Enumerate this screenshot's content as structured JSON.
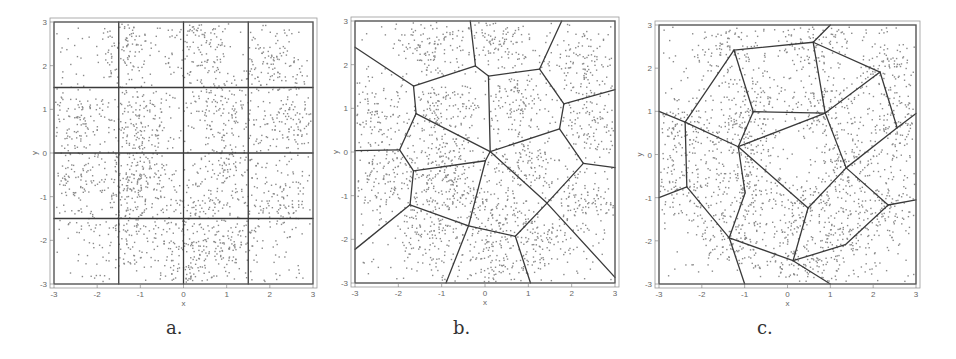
{
  "figure": {
    "captions": [
      "a.",
      "b.",
      "c."
    ]
  },
  "chart_data": [
    {
      "type": "scatter",
      "title": "a.",
      "xlabel": "x",
      "ylabel": "y",
      "xlim": [
        -3,
        3
      ],
      "ylim": [
        -3,
        3
      ],
      "xticks": [
        -3,
        -2,
        -1,
        0,
        1,
        2,
        3
      ],
      "yticks": [
        -3,
        -2,
        -1,
        0,
        1,
        2,
        3
      ],
      "grid": false,
      "frame": {
        "left": 54,
        "top": 22,
        "right": 313,
        "bottom": 284,
        "caption_x": 166,
        "caption_y": 335
      },
      "clusters": [
        {
          "x": -1.3,
          "y": 2.4
        },
        {
          "x": 0.3,
          "y": 2.6
        },
        {
          "x": 2.2,
          "y": 2.0
        },
        {
          "x": -2.5,
          "y": 0.7
        },
        {
          "x": -1.0,
          "y": 0.9
        },
        {
          "x": 0.8,
          "y": 1.1
        },
        {
          "x": 2.5,
          "y": 0.7
        },
        {
          "x": -2.5,
          "y": -0.7
        },
        {
          "x": -1.0,
          "y": -0.9
        },
        {
          "x": 1.0,
          "y": -0.3
        },
        {
          "x": 2.3,
          "y": -1.1
        },
        {
          "x": -1.4,
          "y": -1.9
        },
        {
          "x": 0.1,
          "y": -2.5
        },
        {
          "x": 1.1,
          "y": -2.1
        },
        {
          "x": -1.0,
          "y": -0.2
        },
        {
          "x": 0.3,
          "y": -1.3
        }
      ],
      "partition": {
        "kind": "grid",
        "lines": [
          {
            "x1": -1.5,
            "y1": -3,
            "x2": -1.5,
            "y2": 3
          },
          {
            "x1": 0,
            "y1": -3,
            "x2": 0,
            "y2": 3
          },
          {
            "x1": 1.5,
            "y1": -3,
            "x2": 1.5,
            "y2": 3
          },
          {
            "x1": -3,
            "y1": 1.5,
            "x2": 3,
            "y2": 1.5
          },
          {
            "x1": -3,
            "y1": 0,
            "x2": 3,
            "y2": 0
          },
          {
            "x1": -3,
            "y1": -1.5,
            "x2": 3,
            "y2": -1.5
          }
        ]
      }
    },
    {
      "type": "scatter",
      "title": "b.",
      "xlabel": "x",
      "ylabel": "y",
      "xlim": [
        -3,
        3
      ],
      "ylim": [
        -3,
        3
      ],
      "xticks": [
        -3,
        -2,
        -1,
        0,
        1,
        2,
        3
      ],
      "yticks": [
        -3,
        -2,
        -1,
        0,
        1,
        2,
        3
      ],
      "grid": false,
      "frame": {
        "left": 355,
        "top": 21,
        "right": 615,
        "bottom": 283,
        "caption_x": 453,
        "caption_y": 335
      },
      "clusters": [
        {
          "x": -1.3,
          "y": 2.4
        },
        {
          "x": 0.3,
          "y": 2.6
        },
        {
          "x": 2.2,
          "y": 2.0
        },
        {
          "x": -2.5,
          "y": 0.7
        },
        {
          "x": -1.0,
          "y": 0.9
        },
        {
          "x": 0.8,
          "y": 1.1
        },
        {
          "x": 2.5,
          "y": 0.7
        },
        {
          "x": -2.5,
          "y": -0.7
        },
        {
          "x": -1.0,
          "y": -0.9
        },
        {
          "x": 1.0,
          "y": -0.3
        },
        {
          "x": 2.3,
          "y": -1.1
        },
        {
          "x": -1.4,
          "y": -1.9
        },
        {
          "x": 0.1,
          "y": -2.5
        },
        {
          "x": 1.1,
          "y": -2.1
        },
        {
          "x": -1.0,
          "y": -0.2
        },
        {
          "x": 0.3,
          "y": -1.3
        }
      ],
      "partition": {
        "kind": "voronoi",
        "lines": [
          {
            "x1": -0.34,
            "y1": 3,
            "x2": -0.22,
            "y2": 1.97
          },
          {
            "x1": -0.22,
            "y1": 1.97,
            "x2": -1.65,
            "y2": 1.51
          },
          {
            "x1": -0.22,
            "y1": 1.97,
            "x2": 0.08,
            "y2": 1.74
          },
          {
            "x1": -1.65,
            "y1": 1.51,
            "x2": -3,
            "y2": 2.4
          },
          {
            "x1": -1.65,
            "y1": 1.51,
            "x2": -1.59,
            "y2": 0.88
          },
          {
            "x1": 0.08,
            "y1": 1.74,
            "x2": 1.26,
            "y2": 1.9
          },
          {
            "x1": 0.08,
            "y1": 1.74,
            "x2": 0.12,
            "y2": 0.01
          },
          {
            "x1": 1.77,
            "y1": 3,
            "x2": 1.26,
            "y2": 1.9
          },
          {
            "x1": 1.26,
            "y1": 1.9,
            "x2": 1.82,
            "y2": 1.1
          },
          {
            "x1": 1.82,
            "y1": 1.1,
            "x2": 3,
            "y2": 1.43
          },
          {
            "x1": 1.82,
            "y1": 1.1,
            "x2": 1.72,
            "y2": 0.53
          },
          {
            "x1": 1.72,
            "y1": 0.53,
            "x2": 0.12,
            "y2": 0.01
          },
          {
            "x1": 1.72,
            "y1": 0.53,
            "x2": 2.27,
            "y2": -0.26
          },
          {
            "x1": 2.27,
            "y1": -0.26,
            "x2": 3,
            "y2": -0.36
          },
          {
            "x1": 2.27,
            "y1": -0.26,
            "x2": 1.43,
            "y2": -1.17
          },
          {
            "x1": -1.59,
            "y1": 0.88,
            "x2": 0.12,
            "y2": 0.01
          },
          {
            "x1": -1.59,
            "y1": 0.88,
            "x2": -1.97,
            "y2": 0.05
          },
          {
            "x1": -1.97,
            "y1": 0.05,
            "x2": -3,
            "y2": 0.03
          },
          {
            "x1": -1.97,
            "y1": 0.05,
            "x2": -1.65,
            "y2": -0.43
          },
          {
            "x1": -1.65,
            "y1": -0.43,
            "x2": 0.01,
            "y2": -0.2
          },
          {
            "x1": 0.01,
            "y1": -0.2,
            "x2": 0.12,
            "y2": 0.01
          },
          {
            "x1": 0.01,
            "y1": -0.2,
            "x2": -0.38,
            "y2": -1.69
          },
          {
            "x1": -1.65,
            "y1": -0.43,
            "x2": -1.73,
            "y2": -1.21
          },
          {
            "x1": -1.73,
            "y1": -1.21,
            "x2": -3,
            "y2": -2.23
          },
          {
            "x1": -1.73,
            "y1": -1.21,
            "x2": -0.38,
            "y2": -1.69
          },
          {
            "x1": -0.38,
            "y1": -1.69,
            "x2": 0.7,
            "y2": -1.93
          },
          {
            "x1": -0.38,
            "y1": -1.69,
            "x2": -0.9,
            "y2": -3
          },
          {
            "x1": 0.7,
            "y1": -1.93,
            "x2": 1.43,
            "y2": -1.17
          },
          {
            "x1": 0.7,
            "y1": -1.93,
            "x2": 1.05,
            "y2": -3
          },
          {
            "x1": 1.43,
            "y1": -1.17,
            "x2": 3,
            "y2": -2.87
          },
          {
            "x1": 0.12,
            "y1": 0.01,
            "x2": 1.43,
            "y2": -1.17
          }
        ]
      }
    },
    {
      "type": "scatter",
      "title": "c.",
      "xlabel": "x",
      "ylabel": "y",
      "xlim": [
        -3,
        3
      ],
      "ylim": [
        -3,
        3
      ],
      "xticks": [
        -3,
        -2,
        -1,
        0,
        1,
        2,
        3
      ],
      "yticks": [
        -3,
        -2,
        -1,
        0,
        1,
        2,
        3
      ],
      "grid": false,
      "frame": {
        "left": 659,
        "top": 25,
        "right": 916,
        "bottom": 284,
        "caption_x": 757,
        "caption_y": 335
      },
      "clusters": [
        {
          "x": -1.3,
          "y": 2.4
        },
        {
          "x": 0.6,
          "y": 2.6
        },
        {
          "x": 2.2,
          "y": 1.9
        },
        {
          "x": -2.4,
          "y": 0.7
        },
        {
          "x": -0.8,
          "y": 1.0
        },
        {
          "x": 0.9,
          "y": 1.0
        },
        {
          "x": 2.6,
          "y": 0.6
        },
        {
          "x": -2.4,
          "y": -0.7
        },
        {
          "x": -1.0,
          "y": -0.9
        },
        {
          "x": 1.4,
          "y": -0.3
        },
        {
          "x": 2.3,
          "y": -1.2
        },
        {
          "x": -1.4,
          "y": -1.9
        },
        {
          "x": 0.1,
          "y": -2.5
        },
        {
          "x": 1.3,
          "y": -2.1
        },
        {
          "x": -1.1,
          "y": 0.2
        },
        {
          "x": 0.5,
          "y": -1.2
        }
      ],
      "partition": {
        "kind": "network",
        "nodes": [
          {
            "x": -1.25,
            "y": 2.42
          },
          {
            "x": 0.6,
            "y": 2.6
          },
          {
            "x": 2.16,
            "y": 1.91
          },
          {
            "x": 2.56,
            "y": 0.62
          },
          {
            "x": 0.88,
            "y": 0.96
          },
          {
            "x": -0.8,
            "y": 0.99
          },
          {
            "x": -2.39,
            "y": 0.75
          },
          {
            "x": -1.15,
            "y": 0.18
          },
          {
            "x": -0.99,
            "y": -0.89
          },
          {
            "x": -2.35,
            "y": -0.75
          },
          {
            "x": -1.36,
            "y": -1.93
          },
          {
            "x": 0.13,
            "y": -2.46
          },
          {
            "x": 0.48,
            "y": -1.24
          },
          {
            "x": 1.37,
            "y": -0.31
          },
          {
            "x": 2.35,
            "y": -1.17
          },
          {
            "x": 1.35,
            "y": -2.09
          }
        ],
        "lines": [
          {
            "x1": -3,
            "y1": 1.0,
            "x2": -2.39,
            "y2": 0.75
          },
          {
            "x1": -2.39,
            "y1": 0.75,
            "x2": -1.25,
            "y2": 2.42
          },
          {
            "x1": -1.25,
            "y1": 2.42,
            "x2": 0.6,
            "y2": 2.6
          },
          {
            "x1": 0.6,
            "y1": 2.6,
            "x2": 1.0,
            "y2": 3
          },
          {
            "x1": 0.6,
            "y1": 2.6,
            "x2": 2.16,
            "y2": 1.91
          },
          {
            "x1": 2.16,
            "y1": 1.91,
            "x2": 2.56,
            "y2": 0.62
          },
          {
            "x1": 2.56,
            "y1": 0.62,
            "x2": 3,
            "y2": 0.95
          },
          {
            "x1": 2.56,
            "y1": 0.62,
            "x2": 1.37,
            "y2": -0.31
          },
          {
            "x1": -1.25,
            "y1": 2.42,
            "x2": -0.8,
            "y2": 0.99
          },
          {
            "x1": -0.8,
            "y1": 0.99,
            "x2": 0.88,
            "y2": 0.96
          },
          {
            "x1": 0.6,
            "y1": 2.6,
            "x2": 0.88,
            "y2": 0.96
          },
          {
            "x1": 0.88,
            "y1": 0.96,
            "x2": 2.16,
            "y2": 1.91
          },
          {
            "x1": 0.88,
            "y1": 0.96,
            "x2": -1.15,
            "y2": 0.18
          },
          {
            "x1": -0.8,
            "y1": 0.99,
            "x2": -1.15,
            "y2": 0.18
          },
          {
            "x1": 0.88,
            "y1": 0.96,
            "x2": 1.37,
            "y2": -0.31
          },
          {
            "x1": -2.39,
            "y1": 0.75,
            "x2": -1.15,
            "y2": 0.18
          },
          {
            "x1": -2.39,
            "y1": 0.75,
            "x2": -2.35,
            "y2": -0.75
          },
          {
            "x1": -2.35,
            "y1": -0.75,
            "x2": -3,
            "y2": -1.0
          },
          {
            "x1": -2.35,
            "y1": -0.75,
            "x2": -1.36,
            "y2": -1.93
          },
          {
            "x1": -1.15,
            "y1": 0.18,
            "x2": -0.99,
            "y2": -0.89
          },
          {
            "x1": -0.99,
            "y1": -0.89,
            "x2": -1.36,
            "y2": -1.93
          },
          {
            "x1": -1.15,
            "y1": 0.18,
            "x2": 0.48,
            "y2": -1.24
          },
          {
            "x1": -1.36,
            "y1": -1.93,
            "x2": -1.0,
            "y2": -3
          },
          {
            "x1": -1.36,
            "y1": -1.93,
            "x2": 0.13,
            "y2": -2.46
          },
          {
            "x1": 0.13,
            "y1": -2.46,
            "x2": 1.0,
            "y2": -3
          },
          {
            "x1": 0.13,
            "y1": -2.46,
            "x2": 0.48,
            "y2": -1.24
          },
          {
            "x1": 0.48,
            "y1": -1.24,
            "x2": 1.37,
            "y2": -0.31
          },
          {
            "x1": 1.37,
            "y1": -0.31,
            "x2": 2.35,
            "y2": -1.17
          },
          {
            "x1": 2.35,
            "y1": -1.17,
            "x2": 3,
            "y2": -1.05
          },
          {
            "x1": 2.35,
            "y1": -1.17,
            "x2": 1.35,
            "y2": -2.09
          },
          {
            "x1": 1.35,
            "y1": -2.09,
            "x2": 0.13,
            "y2": -2.46
          }
        ]
      }
    }
  ],
  "style": {
    "point_color": "#8a8a8a",
    "line_color": "#3a3a3a",
    "frame_color": "#555555",
    "points_per_cluster": 110,
    "background_points": 350
  }
}
